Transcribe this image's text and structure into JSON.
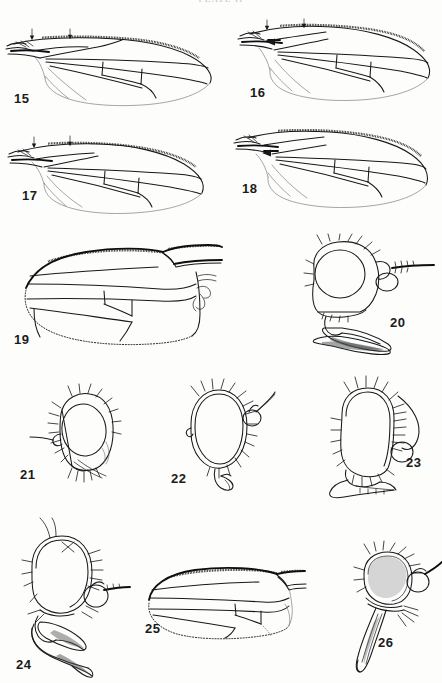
{
  "page": {
    "running_head": "PLATE  II",
    "background_color": "#fdfdfc",
    "ink_color": "#17181a",
    "width": 442,
    "height": 683
  },
  "plate": {
    "title": "Plate of Diptera wings and heads",
    "figures": [
      {
        "id": "fig-15",
        "label": "15",
        "kind": "wing",
        "orientation": "base-left",
        "row": 1,
        "column": 1
      },
      {
        "id": "fig-16",
        "label": "16",
        "kind": "wing",
        "orientation": "base-left",
        "row": 1,
        "column": 2
      },
      {
        "id": "fig-17",
        "label": "17",
        "kind": "wing",
        "orientation": "base-left",
        "row": 2,
        "column": 1
      },
      {
        "id": "fig-18",
        "label": "18",
        "kind": "wing",
        "orientation": "base-left",
        "row": 2,
        "column": 2
      },
      {
        "id": "fig-19",
        "label": "19",
        "kind": "wing",
        "orientation": "base-right",
        "row": 3,
        "column": 1
      },
      {
        "id": "fig-20",
        "label": "20",
        "kind": "head",
        "orientation": "profile",
        "row": 3,
        "column": 2
      },
      {
        "id": "fig-21",
        "label": "21",
        "kind": "head",
        "orientation": "profile",
        "row": 4,
        "column": 1
      },
      {
        "id": "fig-22",
        "label": "22",
        "kind": "head",
        "orientation": "profile",
        "row": 4,
        "column": 2
      },
      {
        "id": "fig-23",
        "label": "23",
        "kind": "head",
        "orientation": "profile",
        "row": 4,
        "column": 3
      },
      {
        "id": "fig-24",
        "label": "24",
        "kind": "head",
        "orientation": "profile",
        "row": 5,
        "column": 1
      },
      {
        "id": "fig-25",
        "label": "25",
        "kind": "wing",
        "orientation": "base-right",
        "row": 5,
        "column": 2
      },
      {
        "id": "fig-26",
        "label": "26",
        "kind": "head",
        "orientation": "profile",
        "row": 5,
        "column": 3
      }
    ],
    "annotations": {
      "arrow_marks": "downward arrows on costa of figures 15, 16, 17"
    }
  }
}
